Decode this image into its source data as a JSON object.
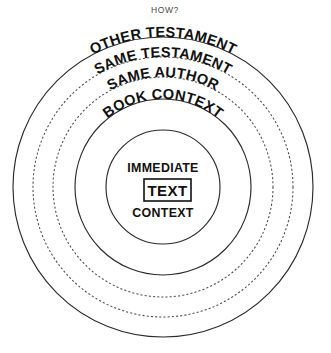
{
  "title": "HOW?",
  "diagram": {
    "kind": "concentric-context-circles",
    "center": {
      "x": 163,
      "y": 187
    },
    "rings": [
      {
        "id": "other-testament",
        "label": "OTHER TESTAMENT",
        "radius": 150,
        "style": "solid"
      },
      {
        "id": "same-testament",
        "label": "SAME TESTAMENT",
        "radius": 130,
        "style": "dashed"
      },
      {
        "id": "same-author",
        "label": "SAME AUTHOR",
        "radius": 110,
        "style": "dashed"
      },
      {
        "id": "book-context",
        "label": "BOOK CONTEXT",
        "radius": 88,
        "style": "solid"
      },
      {
        "id": "immediate-context",
        "label": "",
        "radius": 57,
        "style": "solid"
      }
    ],
    "center_labels": {
      "above": "IMMEDIATE",
      "boxed": "TEXT",
      "below": "CONTEXT"
    }
  },
  "colors": {
    "ink": "#111111",
    "ring_solid": "#2b2b2b",
    "ring_dashed": "#4a4a4a",
    "title": "#4a4a4a",
    "background": "#ffffff"
  }
}
